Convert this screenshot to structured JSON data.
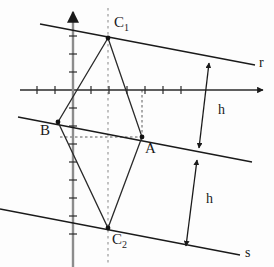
{
  "figure": {
    "background_color": "#fdfdfd",
    "stroke_color": "#1a1a1a",
    "dotted_color": "#9a9a9a"
  },
  "axes": {
    "x_axis": {
      "name": "x-axis",
      "y": 90,
      "x_start": 20,
      "x_end": 266,
      "arrow": "right",
      "tick_spacing": 18,
      "tick_half_length": 4
    },
    "y_axis": {
      "name": "y-axis",
      "x": 73,
      "y_start": 10,
      "y_end": 267,
      "arrow": "up",
      "tick_spacing": 18,
      "tick_half_length": 4
    },
    "origin": {
      "x": 73,
      "y": 90
    }
  },
  "parallel_lines": [
    {
      "id": "r",
      "label": "r",
      "label_x": 258,
      "label_y": 55,
      "x1": 40,
      "y1": 24,
      "x2": 255,
      "y2": 65,
      "passes_through": [
        "C1"
      ]
    },
    {
      "id": "m",
      "label": "",
      "label_x": null,
      "label_y": null,
      "x1": 18,
      "y1": 117,
      "x2": 252,
      "y2": 162,
      "passes_through": [
        "B",
        "A"
      ]
    },
    {
      "id": "s",
      "label": "s",
      "label_x": 244,
      "label_y": 246,
      "x1": 0,
      "y1": 209,
      "x2": 240,
      "y2": 255,
      "passes_through": [
        "C2"
      ]
    }
  ],
  "points": [
    {
      "id": "C1",
      "label": "C",
      "subscript": "1",
      "x": 108,
      "y": 38,
      "label_x": 114,
      "label_y": 22
    },
    {
      "id": "B",
      "label": "B",
      "subscript": "",
      "x": 58,
      "y": 122,
      "label_x": 42,
      "label_y": 130
    },
    {
      "id": "A",
      "label": "A",
      "subscript": "",
      "x": 142,
      "y": 137,
      "label_x": 145,
      "label_y": 145
    },
    {
      "id": "C2",
      "label": "C",
      "subscript": "2",
      "x": 108,
      "y": 228,
      "label_x": 112,
      "label_y": 235
    }
  ],
  "rhombus": {
    "name": "rhombus",
    "vertices": [
      "C1",
      "A",
      "C2",
      "B"
    ],
    "path": "108,38 142,137 108,228 58,122"
  },
  "dotted_guides": [
    {
      "id": "vertical-through-C1-C2",
      "orientation": "vertical",
      "x": 108,
      "y1": 8,
      "y2": 265
    },
    {
      "id": "horizontal-B-to-A",
      "orientation": "horizontal",
      "y": 137,
      "x1": 60,
      "x2": 142
    },
    {
      "id": "vertical-A-to-axis",
      "orientation": "vertical",
      "x": 142,
      "y1": 90,
      "y2": 137
    }
  ],
  "measurements": [
    {
      "id": "h-upper",
      "label": "h",
      "label_x": 218,
      "label_y": 110,
      "x1": 209,
      "y1": 62,
      "x2": 199,
      "y2": 148,
      "arrow_both_ends": true,
      "from_line": "r",
      "to_line": "m"
    },
    {
      "id": "h-lower",
      "label": "h",
      "label_x": 208,
      "label_y": 200,
      "x1": 197,
      "y1": 159,
      "x2": 186,
      "y2": 246,
      "arrow_both_ends": true,
      "from_line": "m",
      "to_line": "s"
    }
  ]
}
